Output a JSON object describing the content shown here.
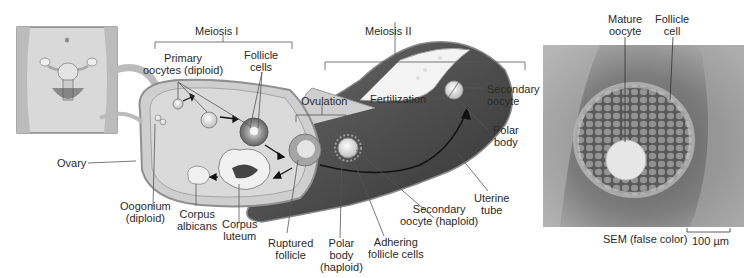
{
  "figure": {
    "color_mode": "grayscale",
    "panels": {
      "body_inset": {
        "description": "Female pelvis showing uterus and ovaries"
      },
      "ovary_diagram": {
        "description": "Ovary with follicle development, ovulation, and uterine tube"
      },
      "sem_micrograph": {
        "description": "Scanning electron micrograph of oocyte surrounded by follicle cells"
      }
    }
  },
  "labels": {
    "meiosis_1": "Meiosis I",
    "meiosis_2": "Meiosis II",
    "primary_oocytes": [
      "Primary",
      "oocytes (diploid)"
    ],
    "follicle_cells": [
      "Follicle",
      "cells"
    ],
    "ovulation": "Ovulation",
    "fertilization": "Fertilization",
    "secondary_oocyte_top": [
      "Secondary",
      "oocyte"
    ],
    "polar_body_top": [
      "Polar",
      "body"
    ],
    "ovary": "Ovary",
    "oogonium": [
      "Oogonium",
      "(diploid)"
    ],
    "corpus_albicans": [
      "Corpus",
      "albicans"
    ],
    "corpus_luteum": [
      "Corpus",
      "luteum"
    ],
    "ruptured_follicle": [
      "Ruptured",
      "follicle"
    ],
    "polar_body_bottom": [
      "Polar",
      "body",
      "(haploid)"
    ],
    "adhering_follicle_cells": [
      "Adhering",
      "follicle cells"
    ],
    "secondary_oocyte_bottom": [
      "Secondary",
      "oocyte (haploid)"
    ],
    "uterine_tube": [
      "Uterine",
      "tube"
    ],
    "mature_oocyte": [
      "Mature",
      "oocyte"
    ],
    "follicle_cell": [
      "Follicle",
      "cell"
    ],
    "sem_caption": "SEM (false color)",
    "scale_bar": "100 µm"
  },
  "colors": {
    "ovary_fill": "#c9c9c9",
    "ovary_edge": "#8f8f8f",
    "tube_dark": "#4a4a4a",
    "sem_bg": "#9a9a9a"
  }
}
